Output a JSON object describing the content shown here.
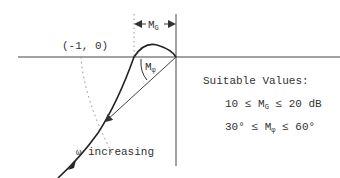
{
  "diagram": {
    "point_label": "(-1, 0)",
    "gain_margin_label": {
      "main": "M",
      "sub": "G"
    },
    "phase_margin_label": {
      "main": "M",
      "sub": "φ"
    },
    "direction_label": {
      "symbol": "ω",
      "text": " increasing"
    },
    "suitable_values": {
      "heading": "Suitable Values:",
      "gain_margin": {
        "low": "10",
        "op": "≤",
        "var": "M",
        "sub": "G",
        "high": "20",
        "unit": "dB"
      },
      "phase_margin": {
        "low": "30°",
        "op": "≤",
        "var": "M",
        "sub": "φ",
        "high": "60°"
      }
    },
    "colors": {
      "line": "#333333",
      "dotted": "#888888",
      "background": "#ffffff"
    }
  }
}
